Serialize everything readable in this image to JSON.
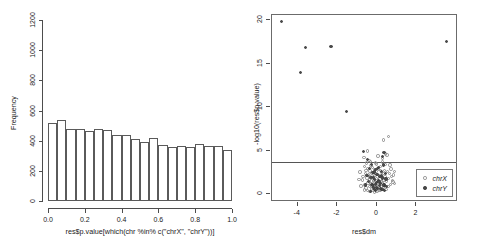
{
  "figure": {
    "background": "#ffffff",
    "width": 488,
    "height": 245,
    "panels": [
      "histogram",
      "volcano"
    ]
  },
  "colors": {
    "axis": "#4d4d4d",
    "frame": "#6b6b6b",
    "bar_outline": "#5a5a5a",
    "bar_fill": "#ffffff",
    "chrX_point": "#8c8c8c",
    "chrY_point": "#4a4a4a",
    "threshold_line": "#555555"
  },
  "chart_data": [
    {
      "type": "bar",
      "id": "histogram",
      "title": "",
      "xlabel": "res$p.value[which(chr %in% c(\"chrX\", \"chrY\"))]",
      "ylabel": "Frequency",
      "xlim": [
        0.0,
        1.0
      ],
      "ylim": [
        0,
        1200
      ],
      "xticks": [
        "0.0",
        "0.2",
        "0.4",
        "0.6",
        "0.8",
        "1.0"
      ],
      "xtick_values": [
        0.0,
        0.2,
        0.4,
        0.6,
        0.8,
        1.0
      ],
      "yticks": [
        "0",
        "200",
        "400",
        "600",
        "800",
        "1000",
        "1200"
      ],
      "ytick_values": [
        0,
        200,
        400,
        600,
        800,
        1000,
        1200
      ],
      "grid": false,
      "bin_width": 0.05,
      "categories": [
        "0.00-0.05",
        "0.05-0.10",
        "0.10-0.15",
        "0.15-0.20",
        "0.20-0.25",
        "0.25-0.30",
        "0.30-0.35",
        "0.35-0.40",
        "0.40-0.45",
        "0.45-0.50",
        "0.50-0.55",
        "0.55-0.60",
        "0.60-0.65",
        "0.65-0.70",
        "0.70-0.75",
        "0.75-0.80",
        "0.80-0.85",
        "0.85-0.90",
        "0.90-0.95",
        "0.95-1.00"
      ],
      "bin_edges": [
        0.0,
        0.05,
        0.1,
        0.15,
        0.2,
        0.25,
        0.3,
        0.35,
        0.4,
        0.45,
        0.5,
        0.55,
        0.6,
        0.65,
        0.7,
        0.75,
        0.8,
        0.85,
        0.9,
        0.95,
        1.0
      ],
      "values": [
        515,
        540,
        475,
        475,
        462,
        478,
        468,
        440,
        440,
        408,
        394,
        415,
        372,
        357,
        363,
        357,
        376,
        366,
        366,
        340
      ]
    },
    {
      "type": "scatter",
      "id": "volcano",
      "title": "",
      "xlabel": "res$dm",
      "ylabel": "-log10(res$p.value)",
      "xlim": [
        -5.3,
        4.1
      ],
      "ylim": [
        -0.9,
        20.6
      ],
      "xticks": [
        "-4",
        "-2",
        "0",
        "2"
      ],
      "xtick_values": [
        -4,
        -2,
        0,
        2
      ],
      "yticks": [
        "0",
        "5",
        "10",
        "15",
        "20"
      ],
      "ytick_values": [
        0,
        5,
        10,
        15,
        20
      ],
      "grid": false,
      "legend_position": "bottom-right",
      "annotations": [
        {
          "kind": "hline",
          "label": "significance threshold",
          "y": 3.65
        }
      ],
      "series": [
        {
          "name": "chrX",
          "marker": "open-circle",
          "color": "#8c8c8c",
          "points": [
            [
              -0.86,
              2.55
            ],
            [
              -0.74,
              1.62
            ],
            [
              -0.7,
              2.05
            ],
            [
              -0.64,
              3.15
            ],
            [
              -0.6,
              1.05
            ],
            [
              -0.57,
              2.4
            ],
            [
              -0.54,
              0.7
            ],
            [
              -0.52,
              3.6
            ],
            [
              -0.5,
              1.85
            ],
            [
              -0.48,
              2.95
            ],
            [
              -0.46,
              0.45
            ],
            [
              -0.44,
              1.3
            ],
            [
              -0.42,
              2.2
            ],
            [
              -0.4,
              3.9
            ],
            [
              -0.38,
              0.9
            ],
            [
              -0.37,
              1.7
            ],
            [
              -0.35,
              2.65
            ],
            [
              -0.34,
              0.3
            ],
            [
              -0.32,
              1.15
            ],
            [
              -0.31,
              2.05
            ],
            [
              -0.29,
              3.3
            ],
            [
              -0.28,
              0.6
            ],
            [
              -0.27,
              1.5
            ],
            [
              -0.25,
              2.45
            ],
            [
              -0.24,
              0.85
            ],
            [
              -0.22,
              1.95
            ],
            [
              -0.21,
              3.05
            ],
            [
              -0.2,
              0.4
            ],
            [
              -0.18,
              1.25
            ],
            [
              -0.17,
              2.3
            ],
            [
              -0.16,
              0.7
            ],
            [
              -0.14,
              1.6
            ],
            [
              -0.13,
              2.8
            ],
            [
              -0.12,
              0.25
            ],
            [
              -0.1,
              1.05
            ],
            [
              -0.09,
              2.15
            ],
            [
              -0.08,
              0.55
            ],
            [
              -0.06,
              1.45
            ],
            [
              -0.05,
              2.6
            ],
            [
              -0.04,
              0.95
            ],
            [
              -0.02,
              1.8
            ],
            [
              -0.01,
              3.45
            ],
            [
              0.01,
              0.35
            ],
            [
              0.02,
              1.2
            ],
            [
              0.04,
              2.25
            ],
            [
              0.05,
              0.65
            ],
            [
              0.07,
              1.55
            ],
            [
              0.08,
              2.9
            ],
            [
              0.1,
              0.45
            ],
            [
              0.11,
              1.35
            ],
            [
              0.13,
              2.1
            ],
            [
              0.14,
              0.8
            ],
            [
              0.16,
              1.75
            ],
            [
              0.17,
              3.2
            ],
            [
              0.19,
              0.5
            ],
            [
              0.2,
              1.4
            ],
            [
              0.22,
              2.5
            ],
            [
              0.23,
              0.9
            ],
            [
              0.25,
              1.9
            ],
            [
              0.27,
              3.7
            ],
            [
              0.28,
              0.6
            ],
            [
              0.3,
              1.3
            ],
            [
              0.32,
              2.35
            ],
            [
              0.34,
              0.75
            ],
            [
              0.36,
              1.65
            ],
            [
              0.38,
              2.75
            ],
            [
              0.4,
              1.0
            ],
            [
              0.42,
              2.0
            ],
            [
              0.45,
              3.4
            ],
            [
              0.47,
              0.55
            ],
            [
              0.5,
              1.5
            ],
            [
              0.53,
              2.6
            ],
            [
              0.56,
              0.85
            ],
            [
              0.6,
              1.8
            ],
            [
              0.64,
              2.4
            ],
            [
              0.68,
              1.1
            ],
            [
              0.72,
              2.9
            ],
            [
              0.78,
              1.55
            ],
            [
              0.84,
              2.2
            ],
            [
              0.9,
              1.25
            ],
            [
              -0.8,
              0.95
            ],
            [
              -0.66,
              4.2
            ],
            [
              -0.62,
              0.5
            ],
            [
              -0.55,
              2.7
            ],
            [
              -0.47,
              4.95
            ],
            [
              -0.33,
              3.75
            ],
            [
              -0.19,
              0.75
            ],
            [
              -0.07,
              3.6
            ],
            [
              0.06,
              4.4
            ],
            [
              0.18,
              2.7
            ],
            [
              0.29,
              4.1
            ],
            [
              0.35,
              6.25
            ],
            [
              0.44,
              4.6
            ],
            [
              0.52,
              4.5
            ],
            [
              0.58,
              6.6
            ],
            [
              0.66,
              3.35
            ],
            [
              0.74,
              2.05
            ],
            [
              0.82,
              1.4
            ],
            [
              0.88,
              2.6
            ],
            [
              -0.9,
              1.7
            ]
          ]
        },
        {
          "name": "chrY",
          "marker": "filled-circle",
          "color": "#4a4a4a",
          "points": [
            [
              -4.8,
              19.85
            ],
            [
              -3.62,
              16.85
            ],
            [
              -3.86,
              13.95
            ],
            [
              -2.32,
              16.95
            ],
            [
              -1.53,
              9.55
            ],
            [
              3.52,
              17.55
            ],
            [
              -0.66,
              4.95
            ],
            [
              -0.46,
              3.95
            ],
            [
              -0.38,
              2.95
            ],
            [
              -0.3,
              1.95
            ],
            [
              -0.25,
              1.15
            ],
            [
              -0.2,
              2.45
            ],
            [
              -0.16,
              0.75
            ],
            [
              -0.12,
              1.65
            ],
            [
              -0.08,
              2.85
            ],
            [
              -0.05,
              0.45
            ],
            [
              -0.02,
              1.35
            ],
            [
              0.01,
              2.25
            ],
            [
              0.04,
              0.65
            ],
            [
              0.07,
              1.55
            ],
            [
              0.1,
              3.05
            ],
            [
              0.13,
              0.95
            ],
            [
              0.16,
              2.05
            ],
            [
              0.19,
              1.25
            ],
            [
              0.22,
              2.65
            ],
            [
              0.26,
              0.55
            ],
            [
              0.3,
              1.85
            ],
            [
              0.34,
              3.35
            ],
            [
              0.38,
              1.05
            ],
            [
              0.43,
              2.35
            ],
            [
              0.48,
              0.85
            ],
            [
              -0.34,
              0.35
            ],
            [
              -0.28,
              3.45
            ],
            [
              -0.22,
              0.95
            ],
            [
              -0.18,
              1.95
            ],
            [
              -0.14,
              0.55
            ],
            [
              -0.1,
              2.55
            ],
            [
              -0.06,
              1.15
            ],
            [
              0.0,
              0.75
            ],
            [
              0.05,
              2.95
            ],
            [
              0.11,
              1.45
            ],
            [
              0.17,
              0.65
            ],
            [
              0.24,
              2.15
            ],
            [
              0.32,
              1.05
            ],
            [
              0.4,
              0.45
            ],
            [
              0.46,
              1.75
            ],
            [
              -0.42,
              1.45
            ],
            [
              -0.5,
              2.15
            ],
            [
              -0.56,
              1.05
            ],
            [
              0.28,
              4.35
            ],
            [
              0.36,
              4.75
            ]
          ]
        }
      ]
    }
  ]
}
